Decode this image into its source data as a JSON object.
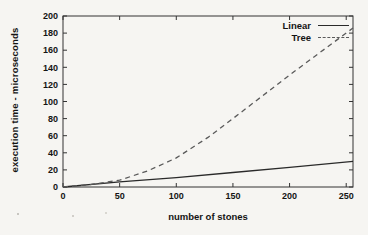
{
  "figure": {
    "background": "#f6f5f2",
    "frame_color": "#333333",
    "text_color": "#141414"
  },
  "chart_data": {
    "type": "line",
    "title": "",
    "xlabel": "number of stones",
    "ylabel": "execution time - microseconds",
    "xlim": [
      0,
      256
    ],
    "ylim": [
      0,
      200
    ],
    "xticks": [
      0,
      50,
      100,
      150,
      200,
      250
    ],
    "yticks": [
      0,
      20,
      40,
      60,
      80,
      100,
      120,
      140,
      160,
      180,
      200
    ],
    "grid": false,
    "legend_position": "top-right-inside",
    "series": [
      {
        "name": "Linear",
        "style": "solid",
        "color": "#2a2a2a",
        "x": [
          0,
          50,
          100,
          150,
          200,
          256
        ],
        "y": [
          0,
          6,
          11,
          17,
          23,
          30
        ]
      },
      {
        "name": "Tree",
        "style": "dashed",
        "color": "#5a5a5a",
        "x": [
          0,
          25,
          50,
          75,
          100,
          128,
          150,
          200,
          256
        ],
        "y": [
          0,
          3,
          8,
          19,
          34,
          58,
          80,
          131,
          186
        ]
      }
    ]
  }
}
